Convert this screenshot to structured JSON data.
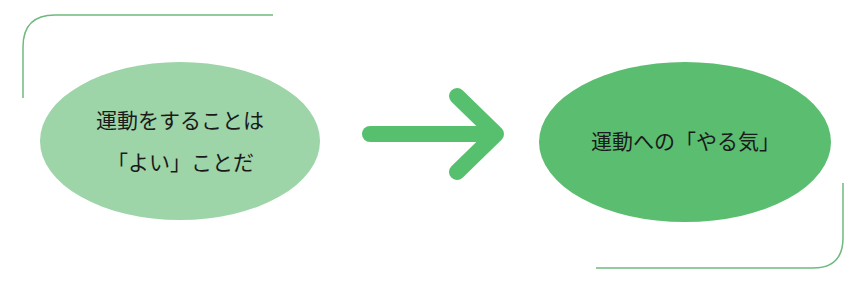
{
  "diagram": {
    "left_node": {
      "lines": [
        "運動をすることは",
        "「よい」ことだ"
      ],
      "fill": "#9dd4a8"
    },
    "arrow": {
      "direction": "right",
      "color": "#56c06e"
    },
    "right_node": {
      "text": "運動への「やる気」",
      "fill": "#5bbd70"
    },
    "frame": {
      "color": "#6fba7e"
    }
  }
}
